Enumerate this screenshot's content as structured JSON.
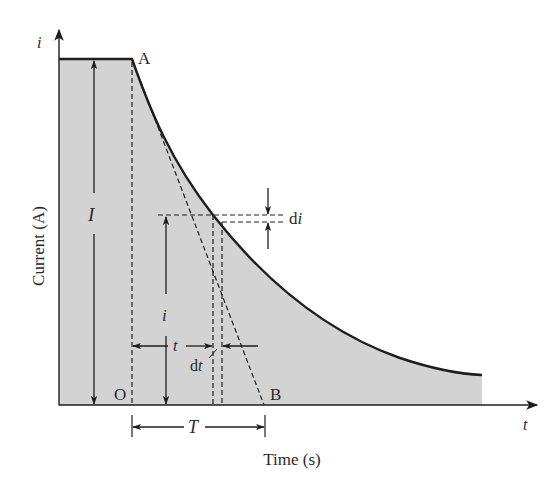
{
  "diagram": {
    "type": "current-decay-curve",
    "colors": {
      "background": "#ffffff",
      "fill": "#d3d3d3",
      "ink": "#1e1e1e"
    },
    "axes": {
      "y_axis_symbol": "i",
      "x_axis_symbol": "t",
      "y_axis_title": "Current (A)",
      "x_axis_title": "Time (s)"
    },
    "points": {
      "A": "A",
      "O": "O",
      "B": "B"
    },
    "dimensions": {
      "initial_current": "I",
      "instant_current": "i",
      "elapsed_time": "t",
      "current_increment": "di",
      "current_increment_prefix": "d",
      "current_increment_var": "i",
      "time_increment_prefix": "d",
      "time_increment_var": "t",
      "time_constant": "T"
    }
  }
}
